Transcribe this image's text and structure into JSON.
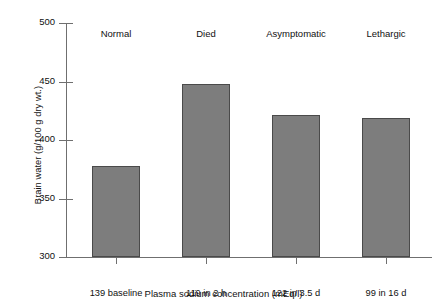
{
  "chart_data": {
    "type": "bar",
    "title": "",
    "subtitle": "",
    "xlabel": "Plasma sodium concentration (mEq/l)",
    "ylabel": "Brain water (g/100 g dry wt.)",
    "categories": [
      "139 baseline",
      "119 in 2 h",
      "122 in 3.5 d",
      "99 in 16 d"
    ],
    "group_labels": [
      "Normal",
      "Died",
      "Asymptomatic",
      "Lethargic"
    ],
    "values": [
      378,
      448,
      421,
      419
    ],
    "ylim": [
      300,
      500
    ],
    "yticks": [
      300,
      350,
      400,
      450,
      500
    ],
    "ytick_labels": [
      "300",
      "350",
      "400",
      "450",
      "500"
    ],
    "grid": false,
    "legend": false,
    "bar_color": "#7d7d7d",
    "bar_edge_color": "#4a4a4a",
    "axis_color": "#6f6f6f",
    "background": "#ffffff"
  }
}
